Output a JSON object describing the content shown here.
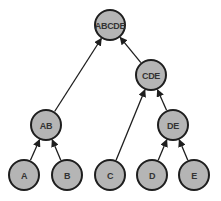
{
  "diagram": {
    "type": "tree",
    "nodes": [
      {
        "id": "ABCDE",
        "label": "ABCDE",
        "x": 110,
        "y": 25
      },
      {
        "id": "CDE",
        "label": "CDE",
        "x": 151,
        "y": 75
      },
      {
        "id": "AB",
        "label": "AB",
        "x": 46,
        "y": 125
      },
      {
        "id": "DE",
        "label": "DE",
        "x": 173,
        "y": 125
      },
      {
        "id": "A",
        "label": "A",
        "x": 24,
        "y": 175
      },
      {
        "id": "B",
        "label": "B",
        "x": 67,
        "y": 175
      },
      {
        "id": "C",
        "label": "C",
        "x": 110,
        "y": 175
      },
      {
        "id": "D",
        "label": "D",
        "x": 152,
        "y": 175
      },
      {
        "id": "E",
        "label": "E",
        "x": 194,
        "y": 175
      }
    ],
    "edges": [
      {
        "from": "AB",
        "to": "ABCDE"
      },
      {
        "from": "CDE",
        "to": "ABCDE"
      },
      {
        "from": "A",
        "to": "AB"
      },
      {
        "from": "B",
        "to": "AB"
      },
      {
        "from": "C",
        "to": "CDE"
      },
      {
        "from": "DE",
        "to": "CDE"
      },
      {
        "from": "D",
        "to": "DE"
      },
      {
        "from": "E",
        "to": "DE"
      }
    ],
    "node_radius": 15,
    "colors": {
      "node_fill": "#b5b5b5",
      "node_stroke": "#1e1e1e",
      "edge": "#1e1e1e"
    }
  }
}
